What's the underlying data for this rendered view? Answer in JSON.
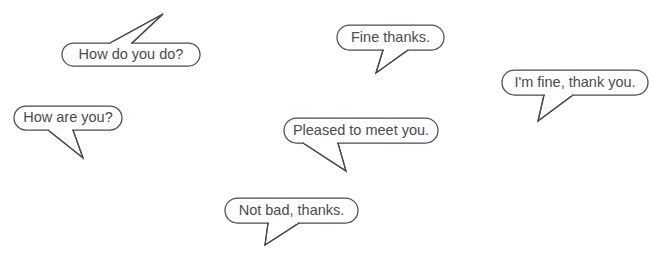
{
  "page": {
    "background_color": "#ffffff",
    "stroke_color": "#4a4a52",
    "text_color": "#4a4a52",
    "width": 653,
    "height": 255
  },
  "bubbles": [
    {
      "id": "how-do-you-do",
      "text": "How do you do?",
      "box": {
        "x": 62,
        "y": 43,
        "w": 138,
        "h": 23,
        "rx": 11.5
      },
      "tail": {
        "base1_x": 110,
        "base1_y": 43,
        "base2_x": 132,
        "base2_y": 43,
        "tip_x": 163,
        "tip_y": 14
      },
      "direction": "up-right"
    },
    {
      "id": "how-are-you",
      "text": "How are you?",
      "box": {
        "x": 14,
        "y": 106,
        "w": 108,
        "h": 24,
        "rx": 12
      },
      "tail": {
        "base1_x": 48,
        "base1_y": 130,
        "base2_x": 73,
        "base2_y": 130,
        "tip_x": 83,
        "tip_y": 158
      },
      "direction": "down-right"
    },
    {
      "id": "fine-thanks",
      "text": "Fine thanks.",
      "box": {
        "x": 337,
        "y": 25,
        "w": 107,
        "h": 25,
        "rx": 12.5
      },
      "tail": {
        "base1_x": 383,
        "base1_y": 50,
        "base2_x": 408,
        "base2_y": 50,
        "tip_x": 376,
        "tip_y": 73
      },
      "direction": "down-left"
    },
    {
      "id": "im-fine-thank-you",
      "text": "I'm fine, thank you.",
      "box": {
        "x": 502,
        "y": 70,
        "w": 146,
        "h": 25,
        "rx": 12.5
      },
      "tail": {
        "base1_x": 544,
        "base1_y": 95,
        "base2_x": 573,
        "base2_y": 95,
        "tip_x": 538,
        "tip_y": 121
      },
      "direction": "down-left"
    },
    {
      "id": "pleased-to-meet-you",
      "text": "Pleased to meet you.",
      "box": {
        "x": 284,
        "y": 118,
        "w": 154,
        "h": 25,
        "rx": 12.5
      },
      "tail": {
        "base1_x": 303,
        "base1_y": 143,
        "base2_x": 338,
        "base2_y": 143,
        "tip_x": 346,
        "tip_y": 171
      },
      "direction": "down-right"
    },
    {
      "id": "not-bad-thanks",
      "text": "Not bad, thanks.",
      "box": {
        "x": 225,
        "y": 198,
        "w": 133,
        "h": 25,
        "rx": 12.5
      },
      "tail": {
        "base1_x": 268,
        "base1_y": 223,
        "base2_x": 299,
        "base2_y": 223,
        "tip_x": 265,
        "tip_y": 245
      },
      "direction": "down-left"
    }
  ],
  "artifact": {
    "text": "",
    "x": 203,
    "y": 6
  }
}
